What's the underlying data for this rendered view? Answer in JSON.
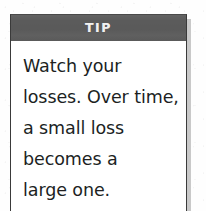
{
  "page": {
    "background_color": "#fefefe"
  },
  "callout": {
    "kind": "tip-box",
    "header": {
      "label": "TIP",
      "background_color": "#5b5b5b",
      "text_color": "#f2f2f2"
    },
    "body": {
      "text": "Watch your losses. Over time, a small loss becomes a large one.",
      "text_color": "#201f1f",
      "background_color": "#ffffff",
      "lines": [
        "Watch your",
        "losses. Over time,",
        "a small loss",
        "becomes a",
        "large one."
      ]
    },
    "border_color": "#3a3a3a",
    "shadow_color": "#c9c9c9"
  }
}
